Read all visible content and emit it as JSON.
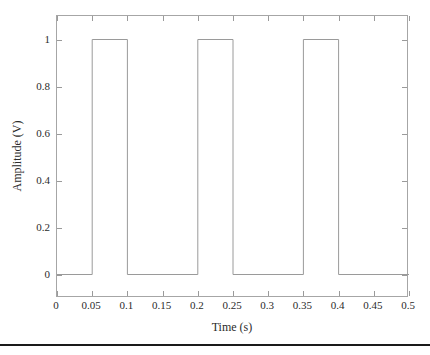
{
  "chart_data": {
    "type": "line",
    "title": "",
    "subtitle": "",
    "xlabel": "Time (s)",
    "ylabel": "Amplitude (V)",
    "xlim": [
      0,
      0.5
    ],
    "ylim": [
      -0.1,
      1.1
    ],
    "xticks": [
      0,
      0.05,
      0.1,
      0.15,
      0.2,
      0.25,
      0.3,
      0.35,
      0.4,
      0.45,
      0.5
    ],
    "xtick_labels": [
      "0",
      "0.05",
      "0.1",
      "0.15",
      "0.2",
      "0.25",
      "0.3",
      "0.35",
      "0.4",
      "0.45",
      "0.5"
    ],
    "yticks": [
      0,
      0.2,
      0.4,
      0.6,
      0.8,
      1
    ],
    "ytick_labels": [
      "0",
      "0.2",
      "0.4",
      "0.6",
      "0.8",
      "1"
    ],
    "grid": false,
    "legend": null,
    "legend_position": "none",
    "line_color": "#9a9a9a",
    "axis_color": "#a6a6a6",
    "text_color": "#2b2b2b",
    "background_color": "#ffffff",
    "series": [
      {
        "name": "Square wave",
        "x": [
          0,
          0.05,
          0.05,
          0.1,
          0.1,
          0.2,
          0.2,
          0.25,
          0.25,
          0.35,
          0.35,
          0.4,
          0.4,
          0.5
        ],
        "y": [
          0,
          0,
          1,
          1,
          0,
          0,
          1,
          1,
          0,
          0,
          1,
          1,
          0,
          0
        ]
      }
    ],
    "pulses": [
      {
        "start": 0.05,
        "end": 0.1,
        "amplitude": 1
      },
      {
        "start": 0.2,
        "end": 0.25,
        "amplitude": 1
      },
      {
        "start": 0.35,
        "end": 0.4,
        "amplitude": 1
      }
    ],
    "baseline": 0,
    "period": 0.15,
    "pulse_width": 0.05,
    "duty_cycle_percent": 33.3
  }
}
